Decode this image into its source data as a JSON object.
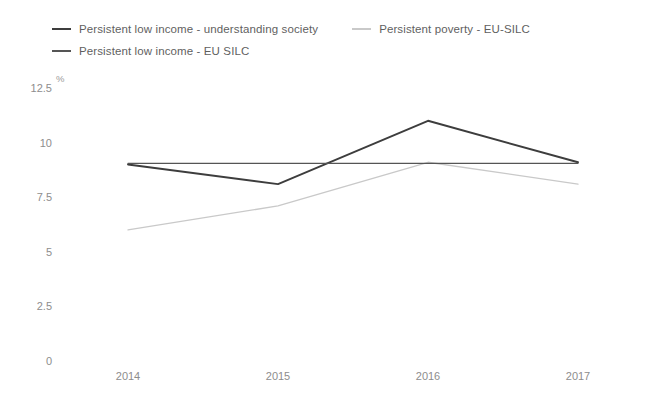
{
  "chart_data": {
    "type": "line",
    "title": "",
    "xlabel": "",
    "ylabel": "%",
    "categories": [
      "2014",
      "2015",
      "2016",
      "2017"
    ],
    "x": [
      2014,
      2015,
      2016,
      2017
    ],
    "ylim": [
      0,
      12.5
    ],
    "yticks": [
      "0",
      "2.5",
      "5",
      "7.5",
      "10",
      "12.5"
    ],
    "ytick_values": [
      0,
      2.5,
      5,
      7.5,
      10,
      12.5
    ],
    "grid": false,
    "legend_position": "top-left",
    "series": [
      {
        "name": "Persistent low income - understanding society",
        "values": [
          9.0,
          8.1,
          11.0,
          9.1
        ],
        "color": "#3d3d3d"
      },
      {
        "name": "Persistent poverty - EU-SILC",
        "values": [
          6.0,
          7.1,
          9.1,
          8.1
        ],
        "color": "#c9c9c9"
      },
      {
        "name": "Persistent low income - EU SILC",
        "values": [
          9.05,
          9.05,
          9.05,
          9.05
        ],
        "color": "#555555"
      }
    ]
  },
  "legend": {
    "items": [
      {
        "label": "Persistent low income - understanding society",
        "color": "#3d3d3d"
      },
      {
        "label": "Persistent poverty - EU-SILC",
        "color": "#c9c9c9"
      },
      {
        "label": "Persistent low income - EU SILC",
        "color": "#555555"
      }
    ]
  },
  "axis": {
    "y_unit": "%",
    "y_labels": [
      "12.5",
      "10",
      "7.5",
      "5",
      "2.5",
      "0"
    ],
    "x_labels": [
      "2014",
      "2015",
      "2016",
      "2017"
    ]
  }
}
